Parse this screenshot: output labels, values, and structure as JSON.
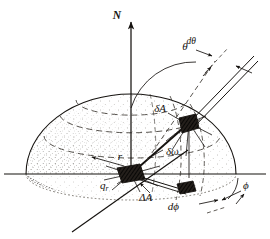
{
  "figure": {
    "background_color": "#ffffff",
    "ink_color": "#15120f"
  },
  "labels": {
    "north_axis": "N",
    "zenith_angle": "θ",
    "zenith_increment": "dθ",
    "azimuth_angle": "ϕ",
    "azimuth_increment": "dϕ",
    "sphere_patch": "δA",
    "solid_angle": "δω",
    "surface_element": "ΔA",
    "radius": "r",
    "radial_flux_base": "q",
    "radial_flux_sub": "r"
  },
  "geometry": {
    "origin_x": 131,
    "origin_y": 174,
    "sphere_radius_x": 105,
    "sphere_radius_y": 80,
    "base_ellipse_ry": 26,
    "sphere_point_x": 189,
    "sphere_point_y": 123,
    "base_point_x": 182,
    "base_point_y": 192,
    "apex_x": 131,
    "apex_y": 16
  },
  "colors": {
    "ink": "#15120f",
    "stipple": "#2a2622",
    "dash": "#3a352f",
    "paper": "#ffffff"
  }
}
